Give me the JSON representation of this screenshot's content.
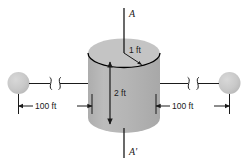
{
  "figure": {
    "type": "engineering-diagram",
    "background_color": "#ffffff"
  },
  "colors": {
    "body_fill": "#b3b3b3",
    "top_fill": "#c4c4c4",
    "sphere_fill": "#c9c9c9",
    "line": "#1a1a1a",
    "outline": "#000000"
  },
  "cylinder": {
    "name": "cylinder",
    "radius_label": "1 ft",
    "height_label": "2 ft"
  },
  "axis": {
    "top_label": "A",
    "bottom_label": "A'"
  },
  "dimensions": {
    "left": {
      "label": "100 ft"
    },
    "right": {
      "label": "100 ft"
    }
  },
  "spheres": {
    "left_name": "left-sphere",
    "right_name": "right-sphere"
  }
}
